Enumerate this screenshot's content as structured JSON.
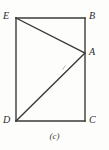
{
  "figure": {
    "caption": "(c)",
    "type": "geometry-diagram",
    "background_color": "#fdfdfc",
    "stroke_color": "#3a3a3a",
    "label_color": "#2b2b2b",
    "canvas": {
      "width": 109,
      "height": 150
    },
    "vertices": [
      {
        "id": "E",
        "label": "E",
        "x": 16,
        "y": 18
      },
      {
        "id": "B",
        "label": "B",
        "x": 85,
        "y": 18
      },
      {
        "id": "A",
        "label": "A",
        "x": 85,
        "y": 53
      },
      {
        "id": "C",
        "label": "C",
        "x": 85,
        "y": 121
      },
      {
        "id": "D",
        "label": "D",
        "x": 16,
        "y": 121
      }
    ],
    "segments": [
      {
        "name": "EB",
        "from": "E",
        "to": "B"
      },
      {
        "name": "BC",
        "from": "B",
        "to": "C"
      },
      {
        "name": "CD",
        "from": "C",
        "to": "D"
      },
      {
        "name": "DE",
        "from": "D",
        "to": "E"
      },
      {
        "name": "EA",
        "from": "E",
        "to": "A"
      },
      {
        "name": "DA",
        "from": "D",
        "to": "A"
      }
    ],
    "tick_marks": [
      {
        "name": "tick-on-DA",
        "x": 64,
        "y": 67
      }
    ]
  }
}
